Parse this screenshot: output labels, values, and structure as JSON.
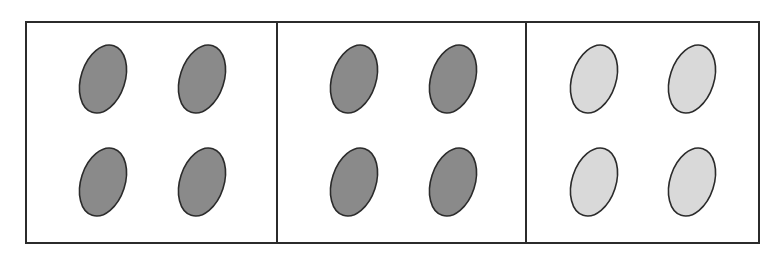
{
  "diagram": {
    "outline_color": "#2b2b2b",
    "panels": [
      {
        "id": "panel-1",
        "x": 26,
        "fill": "#8a8a8a",
        "label": "dark ovals"
      },
      {
        "id": "panel-2",
        "x": 277,
        "fill": "#8a8a8a",
        "label": "dark ovals"
      },
      {
        "id": "panel-3",
        "x": 526,
        "fill": "#d9d9d9",
        "label": "light ovals"
      }
    ],
    "panel_widths": [
      251,
      249,
      233
    ],
    "oval_count_per_panel": 4
  }
}
